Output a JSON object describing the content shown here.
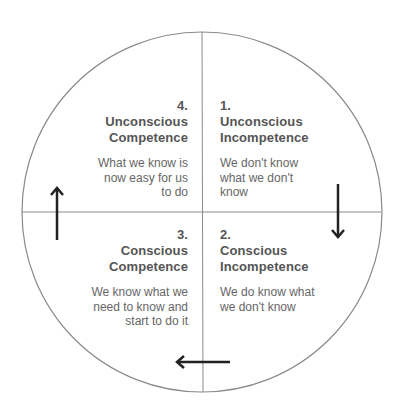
{
  "diagram": {
    "type": "competence-cycle",
    "colors": {
      "circle": "#8a8a8a",
      "arrow": "#222222",
      "text": "#555555"
    },
    "quadrants": [
      {
        "position": "top-right",
        "number": "1.",
        "title_line1": "Unconscious",
        "title_line2": "Incompetence",
        "desc_line1": "We don't know",
        "desc_line2": "what we don't",
        "desc_line3": "know"
      },
      {
        "position": "bottom-right",
        "number": "2.",
        "title_line1": "Conscious",
        "title_line2": "Incompetence",
        "desc_line1": "We do know what",
        "desc_line2": "we don't know",
        "desc_line3": ""
      },
      {
        "position": "bottom-left",
        "number": "3.",
        "title_line1": "Conscious",
        "title_line2": "Competence",
        "desc_line1": "We know what we",
        "desc_line2": "need to know and",
        "desc_line3": "start to do it"
      },
      {
        "position": "top-left",
        "number": "4.",
        "title_line1": "Unconscious",
        "title_line2": "Competence",
        "desc_line1": "What we know is",
        "desc_line2": "now easy for us",
        "desc_line3": "to do"
      }
    ],
    "arrows": [
      {
        "name": "down",
        "from": "quadrant-1",
        "to": "quadrant-2"
      },
      {
        "name": "left",
        "from": "quadrant-2",
        "to": "quadrant-3"
      },
      {
        "name": "up",
        "from": "quadrant-3",
        "to": "quadrant-4"
      }
    ]
  }
}
